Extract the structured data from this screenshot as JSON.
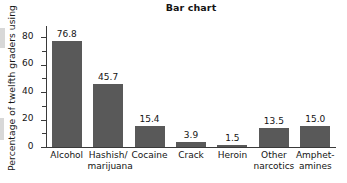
{
  "chart_data": {
    "type": "bar",
    "title": "Bar chart",
    "xlabel": "",
    "ylabel": "Percentage of twelfth graders using",
    "categories": [
      "Alcohol",
      "Hashish/ marijuana",
      "Cocaine",
      "Crack",
      "Heroin",
      "Other narcotics",
      "Amphet- amines"
    ],
    "category_lines": [
      [
        "Alcohol"
      ],
      [
        "Hashish/",
        "marijuana"
      ],
      [
        "Cocaine"
      ],
      [
        "Crack"
      ],
      [
        "Heroin"
      ],
      [
        "Other",
        "narcotics"
      ],
      [
        "Amphet-",
        "amines"
      ]
    ],
    "values": [
      76.8,
      45.7,
      15.4,
      3.9,
      1.5,
      13.5,
      15.0
    ],
    "value_labels": [
      "76.8",
      "45.7",
      "15.4",
      "3.9",
      "1.5",
      "13.5",
      "15.0"
    ],
    "ylim": [
      0,
      88
    ],
    "yticks": [
      0,
      20,
      40,
      60,
      80
    ],
    "ytick_labels": [
      "0",
      "20",
      "40",
      "60",
      "80"
    ],
    "yticks_minor": [
      10,
      30,
      50,
      70
    ],
    "grid": false,
    "legend": false,
    "bar_color": "#595959",
    "axis_color": "#3a3a3a",
    "text_color": "#141414",
    "background": "#ffffff"
  }
}
